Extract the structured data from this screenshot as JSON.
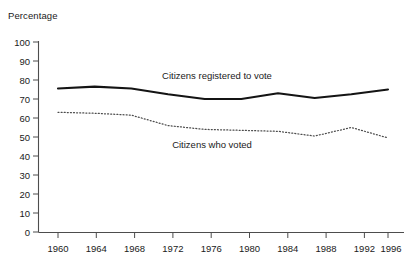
{
  "chart_data": {
    "type": "line",
    "title": "",
    "subtitle": "",
    "xlabel": "",
    "ylabel": "Percentage",
    "ylim": [
      0,
      100
    ],
    "xlim": [
      1960,
      1996
    ],
    "grid": false,
    "legend_position": "inline-annotations",
    "y_ticks": [
      "0",
      "10",
      "20",
      "30",
      "40",
      "50",
      "60",
      "70",
      "80",
      "90",
      "100"
    ],
    "x_ticks": [
      "1960",
      "1964",
      "1968",
      "1972",
      "1976",
      "1980",
      "1984",
      "1988",
      "1992",
      "1996"
    ],
    "x": [
      1960,
      1964,
      1968,
      1972,
      1976,
      1980,
      1984,
      1988,
      1992,
      1996
    ],
    "series": [
      {
        "name": "Citizens registered to vote",
        "style": "solid",
        "color": "#141414",
        "values": [
          75.5,
          76.5,
          75.5,
          72.5,
          70.0,
          70.0,
          73.0,
          70.5,
          72.5,
          75.0
        ],
        "annotation": "Citizens registered to vote"
      },
      {
        "name": "Citizens who voted",
        "style": "dotted",
        "color": "#4d4d4d",
        "values": [
          63.0,
          62.5,
          61.5,
          56.0,
          54.0,
          53.5,
          53.0,
          50.5,
          55.0,
          49.5
        ],
        "annotation": "Citizens who voted"
      }
    ],
    "annotations": [
      {
        "text": "Citizens registered to vote",
        "x": 1971.5,
        "y": 80.5
      },
      {
        "text": "Citizens who voted",
        "x": 1972.5,
        "y": 46.5
      }
    ]
  }
}
